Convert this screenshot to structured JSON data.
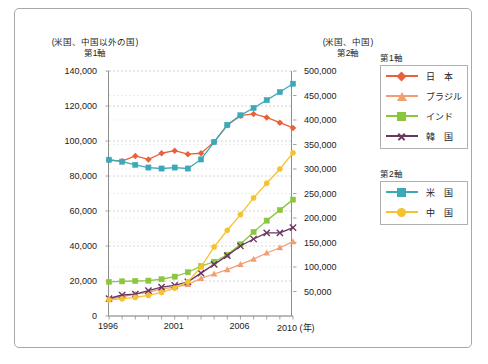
{
  "chart_data": {
    "type": "line",
    "title": "",
    "xlabel": "(年)",
    "axis_left_caption_line1": "(米国、中国以外の国)",
    "axis_left_caption_line2": "第1軸",
    "axis_right_caption_line1": "(米国、中国)",
    "axis_right_caption_line2": "第2軸",
    "x": [
      1996,
      1997,
      1998,
      1999,
      2000,
      2001,
      2002,
      2003,
      2004,
      2005,
      2006,
      2007,
      2008,
      2009,
      2010
    ],
    "xtick_labels": [
      "1996",
      "2001",
      "2006",
      "2010"
    ],
    "xtick_values": [
      1996,
      2001,
      2006,
      2010
    ],
    "xlim": [
      1996,
      2010
    ],
    "ylim_left": [
      0,
      140000
    ],
    "ylim_right": [
      0,
      500000
    ],
    "ytick_left": [
      "0",
      "20,000",
      "40,000",
      "60,000",
      "80,000",
      "100,000",
      "120,000",
      "140,000"
    ],
    "ytick_left_values": [
      0,
      20000,
      40000,
      60000,
      80000,
      100000,
      120000,
      140000
    ],
    "ytick_right": [
      "50,000",
      "100,000",
      "150,000",
      "200,000",
      "250,000",
      "300,000",
      "350,000",
      "400,000",
      "450,000",
      "500,000"
    ],
    "ytick_right_values": [
      50000,
      100000,
      150000,
      200000,
      250000,
      300000,
      350000,
      400000,
      450000,
      500000
    ],
    "grid": true,
    "legend_position": "right",
    "series": [
      {
        "name": "日　本",
        "axis": "left",
        "color": "#e8613c",
        "marker": "diamond",
        "values": [
          89000,
          88500,
          91500,
          89500,
          93000,
          94500,
          92500,
          93000,
          99500,
          109000,
          114500,
          115500,
          113500,
          110500,
          107500
        ]
      },
      {
        "name": "ブラジル",
        "axis": "left",
        "color": "#f0a070",
        "marker": "triangle",
        "values": [
          9500,
          11000,
          12500,
          13500,
          15500,
          16500,
          18000,
          21500,
          24000,
          26500,
          29500,
          32500,
          36000,
          39000,
          42500
        ]
      },
      {
        "name": "インド",
        "axis": "left",
        "color": "#8cc63f",
        "marker": "square",
        "values": [
          19500,
          19800,
          20000,
          20200,
          21000,
          22500,
          25000,
          28500,
          31000,
          35000,
          41000,
          48000,
          54500,
          60500,
          66500
        ]
      },
      {
        "name": "韓　国",
        "axis": "left",
        "color": "#6b3560",
        "marker": "x",
        "values": [
          10000,
          12000,
          12500,
          14500,
          16500,
          17500,
          19500,
          24500,
          29500,
          34500,
          40000,
          44000,
          47500,
          47500,
          50500
        ]
      },
      {
        "name": "米　国",
        "axis": "right",
        "color": "#3ba9b8",
        "marker": "square",
        "values": [
          319000,
          315000,
          308500,
          303000,
          301000,
          303000,
          301000,
          319500,
          355000,
          390000,
          409500,
          424500,
          440500,
          457000,
          474000
        ]
      },
      {
        "name": "中　国",
        "axis": "right",
        "color": "#f5c231",
        "marker": "circle",
        "values": [
          33000,
          35000,
          38000,
          42000,
          48000,
          57000,
          70000,
          100000,
          141000,
          175000,
          207000,
          241000,
          271000,
          300000,
          333000
        ]
      }
    ]
  },
  "legend": {
    "group1_title": "第1軸",
    "group2_title": "第2軸",
    "group1_items": [
      {
        "label": "日　本",
        "color": "#e8613c",
        "marker": "diamond"
      },
      {
        "label": "ブラジル",
        "color": "#f0a070",
        "marker": "triangle"
      },
      {
        "label": "インド",
        "color": "#8cc63f",
        "marker": "square"
      },
      {
        "label": "韓　国",
        "color": "#6b3560",
        "marker": "x"
      }
    ],
    "group2_items": [
      {
        "label": "米　国",
        "color": "#3ba9b8",
        "marker": "square"
      },
      {
        "label": "中　国",
        "color": "#f5c231",
        "marker": "circle"
      }
    ]
  },
  "colors": {
    "frame_border": "#a8a8a8",
    "axis_line": "#8c8c8c",
    "gridline": "#c9c9c9",
    "text": "#1c1c1c"
  }
}
